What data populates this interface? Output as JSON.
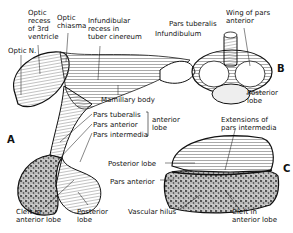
{
  "figure": {
    "panels": [
      {
        "id": "A",
        "letter": "A",
        "labels": {
          "optic_recess": "Optic\nrecess\nof 3rd\nventricle",
          "optic_chiasma": "Optic\nchiasma",
          "infundibular_recess": "Infundibular\nrecess in\ntuber cinereum",
          "optic_nerve": "Optic N.",
          "mamillary_body": "Mamillary body",
          "pars_tuberalis": "Pars tuberalis",
          "pars_anterior": "Pars anterior",
          "pars_intermedia": "Pars intermedia",
          "anterior_lobe_group": "anterior\nlobe",
          "cleft": "Cleft in\nanterior lobe",
          "posterior_lobe": "Posterior\nlobe"
        }
      },
      {
        "id": "B",
        "letter": "B",
        "labels": {
          "pars_tuberalis": "Pars tuberalis",
          "infundibulum": "Infundibulum",
          "wing": "Wing of pars\nanterior",
          "posterior_lobe": "Posterior\nlobe"
        }
      },
      {
        "id": "C",
        "letter": "C",
        "labels": {
          "extensions": "Extensions of\npars intermedia",
          "posterior_lobe": "Posterior lobe",
          "pars_anterior": "Pars anterior",
          "vascular_hilus": "Vascular hilus",
          "cleft": "Cleft in\nanterior lobe"
        }
      }
    ]
  }
}
